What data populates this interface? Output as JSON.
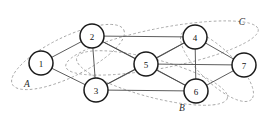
{
  "figure": {
    "background_color": "#ffffff",
    "width": 280,
    "height": 124
  },
  "chart_data": {
    "type": "diagram",
    "title": "",
    "node_color": "#ffffff",
    "node_stroke_color": "#1a1a1a",
    "edge_color": "#4a4a4a",
    "cluster_stroke_color": "#9a9a9a",
    "nodes": [
      {
        "id": "1",
        "label": "1",
        "x": 41,
        "y": 63,
        "r": 12
      },
      {
        "id": "2",
        "label": "2",
        "x": 92,
        "y": 36,
        "r": 12
      },
      {
        "id": "3",
        "label": "3",
        "x": 96,
        "y": 90,
        "r": 12
      },
      {
        "id": "4",
        "label": "4",
        "x": 195,
        "y": 37,
        "r": 12
      },
      {
        "id": "5",
        "label": "5",
        "x": 146,
        "y": 64,
        "r": 12
      },
      {
        "id": "6",
        "label": "6",
        "x": 196,
        "y": 91,
        "r": 12
      },
      {
        "id": "7",
        "label": "7",
        "x": 244,
        "y": 65,
        "r": 12
      }
    ],
    "edges": [
      {
        "from": "1",
        "to": "2"
      },
      {
        "from": "1",
        "to": "3"
      },
      {
        "from": "2",
        "to": "3"
      },
      {
        "from": "2",
        "to": "4"
      },
      {
        "from": "2",
        "to": "5"
      },
      {
        "from": "2",
        "to": "6"
      },
      {
        "from": "3",
        "to": "5"
      },
      {
        "from": "3",
        "to": "6"
      },
      {
        "from": "3",
        "to": "4"
      },
      {
        "from": "4",
        "to": "5"
      },
      {
        "from": "4",
        "to": "6"
      },
      {
        "from": "4",
        "to": "7"
      },
      {
        "from": "5",
        "to": "6"
      },
      {
        "from": "5",
        "to": "7"
      },
      {
        "from": "6",
        "to": "7"
      }
    ],
    "clusters": [
      {
        "id": "A",
        "label": "A",
        "label_x": 27,
        "label_y": 84,
        "cx": 68,
        "cy": 57,
        "rx": 62,
        "ry": 20,
        "rotation": -26
      },
      {
        "id": "B",
        "label": "B",
        "label_x": 182,
        "label_y": 108,
        "cx": 152,
        "cy": 78,
        "rx": 78,
        "ry": 19,
        "rotation": 15
      },
      {
        "id": "C",
        "label": "C",
        "label_x": 242,
        "label_y": 22,
        "cx": 162,
        "cy": 48,
        "rx": 98,
        "ry": 20,
        "rotation": -11
      },
      {
        "id": "D",
        "label": "",
        "label_x": 0,
        "label_y": 0,
        "cx": 217,
        "cy": 66,
        "rx": 48,
        "ry": 17,
        "rotation": 44
      }
    ]
  }
}
